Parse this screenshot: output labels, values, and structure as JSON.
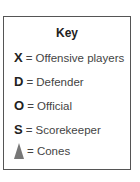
{
  "key": {
    "title": "Key",
    "items": [
      {
        "symbol": "X",
        "label": "= Offensive players"
      },
      {
        "symbol": "D",
        "label": "= Defender"
      },
      {
        "symbol": "O",
        "label": "= Official"
      },
      {
        "symbol": "S",
        "label": "= Scorekeeper"
      },
      {
        "symbol": "cone-icon",
        "label": "= Cones"
      }
    ]
  }
}
